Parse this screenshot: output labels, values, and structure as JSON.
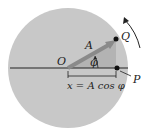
{
  "diagram": {
    "type": "phasor-circle",
    "labels": {
      "origin": "O",
      "amplitude": "A",
      "angle": "φ",
      "point_q": "Q",
      "point_p": "P",
      "projection": "x = A cos φ"
    },
    "colors": {
      "circle_fill": "#c8c8c8",
      "phasor": "#8a8a8a",
      "triangle": "#b0b0b0",
      "line": "#222222"
    }
  }
}
